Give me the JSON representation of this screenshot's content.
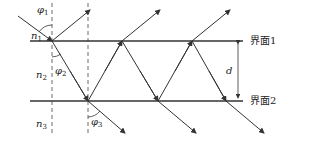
{
  "interfaces": [
    {
      "label": "界面1",
      "y": 41
    },
    {
      "label": "界面2",
      "y": 101
    }
  ],
  "media": [
    {
      "symbol": "n",
      "sub": "1"
    },
    {
      "symbol": "n",
      "sub": "2"
    },
    {
      "symbol": "n",
      "sub": "3"
    }
  ],
  "angles": [
    {
      "symbol": "φ",
      "sub": "1"
    },
    {
      "symbol": "φ",
      "sub": "2"
    },
    {
      "symbol": "φ",
      "sub": "3"
    }
  ],
  "thickness_label": "d",
  "colors": {
    "line": "#333333"
  }
}
